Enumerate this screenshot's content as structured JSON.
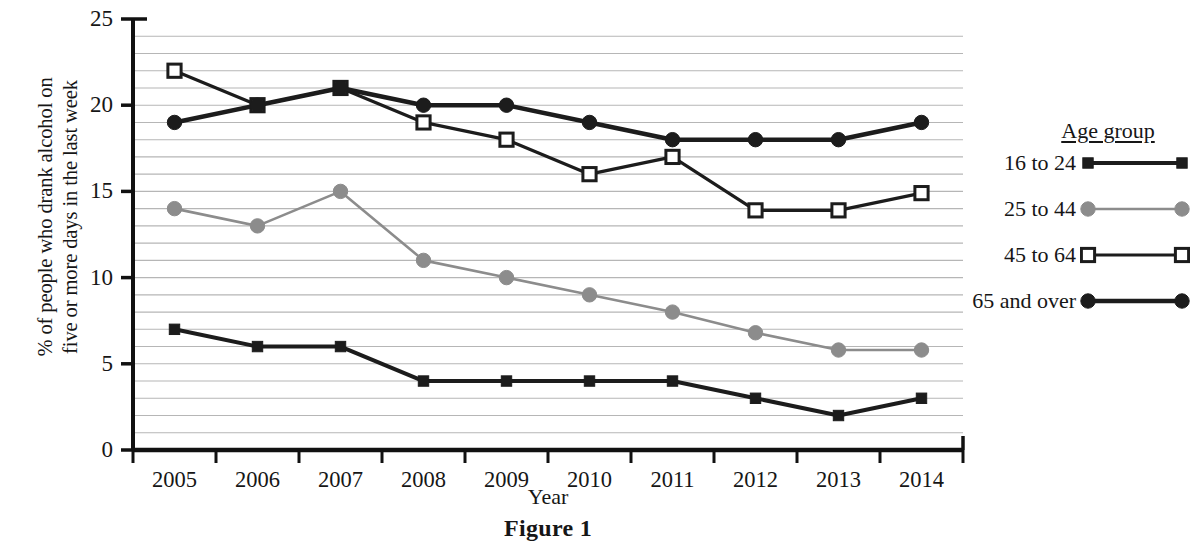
{
  "figure": {
    "caption": "Figure 1"
  },
  "axes": {
    "ylabel": "% of people who drank alcohol on\nfive or more days in the last week",
    "xlabel": "Year",
    "yticks": [
      "0",
      "5",
      "10",
      "15",
      "20",
      "25"
    ],
    "xticks": [
      "2005",
      "2006",
      "2007",
      "2008",
      "2009",
      "2010",
      "2011",
      "2012",
      "2013",
      "2014"
    ]
  },
  "legend": {
    "title": "Age group",
    "entries": [
      {
        "label": "16 to 24",
        "marker": "filled-square",
        "color": "#1c1c1c",
        "line_width": 4.0
      },
      {
        "label": "25 to 44",
        "marker": "filled-circle",
        "color": "#8c8c8c",
        "line_width": 2.6
      },
      {
        "label": "45 to 64",
        "marker": "open-square",
        "color": "#1c1c1c",
        "line_width": 3.2
      },
      {
        "label": "65 and over",
        "marker": "filled-circle",
        "color": "#1c1c1c",
        "line_width": 4.6
      }
    ]
  },
  "chart_data": {
    "type": "line",
    "title": "",
    "xlabel": "Year",
    "ylabel": "% of people who drank alcohol on five or more days in the last week",
    "x": [
      2005,
      2006,
      2007,
      2008,
      2009,
      2010,
      2011,
      2012,
      2013,
      2014
    ],
    "categories": [
      "2005",
      "2006",
      "2007",
      "2008",
      "2009",
      "2010",
      "2011",
      "2012",
      "2013",
      "2014"
    ],
    "ylim": [
      0,
      25
    ],
    "yticks": [
      0,
      5,
      10,
      15,
      20,
      25
    ],
    "grid": "horizontal-minor-every-1",
    "legend_position": "right",
    "series": [
      {
        "name": "16 to 24",
        "color": "#1c1c1c",
        "marker": "filled-square",
        "values": [
          7,
          6,
          6,
          4,
          4,
          4,
          4,
          3,
          2,
          3
        ]
      },
      {
        "name": "25 to 44",
        "color": "#8c8c8c",
        "marker": "filled-circle",
        "values": [
          14,
          13,
          15,
          11,
          10,
          9,
          8,
          6.8,
          5.8,
          5.8
        ]
      },
      {
        "name": "45 to 64",
        "color": "#1c1c1c",
        "marker": "open-square",
        "values": [
          22,
          20,
          21,
          19,
          18,
          16,
          17,
          13.9,
          13.9,
          14.9
        ]
      },
      {
        "name": "65 and over",
        "color": "#1c1c1c",
        "marker": "filled-circle",
        "values": [
          19,
          20,
          21,
          20,
          20,
          19,
          18,
          18,
          18,
          19
        ]
      }
    ]
  }
}
